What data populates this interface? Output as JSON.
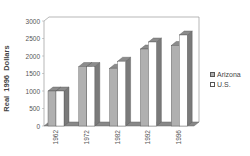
{
  "chart_data": {
    "type": "bar",
    "title": "",
    "xlabel": "",
    "ylabel": "Real  1996  Dollars",
    "ylim": [
      0,
      3000
    ],
    "yticks": [
      0,
      500,
      1000,
      1500,
      2000,
      2500,
      3000
    ],
    "categories": [
      "1962",
      "1972",
      "1982",
      "1992",
      "1996"
    ],
    "series": [
      {
        "name": "Arizona",
        "values": [
          1000,
          1700,
          1650,
          2200,
          2300
        ],
        "color": "#b0b0b0"
      },
      {
        "name": "U.S.",
        "values": [
          1000,
          1700,
          1850,
          2400,
          2600
        ],
        "color": "#ffffff"
      }
    ],
    "legend_position": "right",
    "grid": false,
    "style": "3d"
  },
  "legend": {
    "items": [
      {
        "label": "Arizona",
        "color": "#b0b0b0"
      },
      {
        "label": "U.S.",
        "color": "#ffffff"
      }
    ]
  }
}
